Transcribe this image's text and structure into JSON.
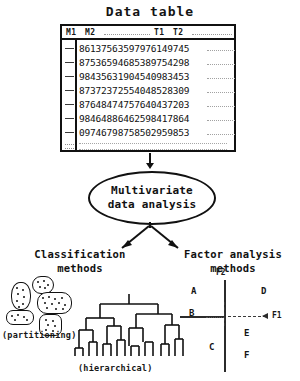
{
  "diagram": {
    "title": "Data table",
    "table": {
      "columns": [
        "M1",
        "M2",
        "T1",
        "T2"
      ],
      "rows": [
        "86137563597976149745",
        "87536594685389754298",
        "98435631904540983453",
        "87372372554048528309",
        "87648474757640437203",
        "98464886462598417864",
        "09746798758502959853"
      ]
    },
    "process": {
      "line1": "Multivariate",
      "line2": "data analysis"
    },
    "branches": {
      "left": {
        "title_line1": "Classification",
        "title_line2": "methods",
        "method_a": "(partitioning)",
        "method_b": "(hierarchical)"
      },
      "right": {
        "title_line1": "Factor analysis",
        "title_line2": "methods",
        "axis_x": "F1",
        "axis_y": "F2",
        "points": [
          "A",
          "B",
          "C",
          "D",
          "E",
          "F"
        ]
      }
    },
    "colors": {
      "ink": "#111111",
      "background": "#ffffff",
      "faint": "#a2a2a2"
    }
  }
}
